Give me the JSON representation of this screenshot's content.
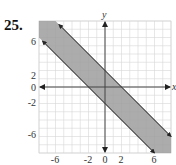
{
  "problem": {
    "number": "25."
  },
  "chart_data": {
    "type": "area",
    "title": "",
    "xlabel": "x",
    "ylabel": "y",
    "xlim": [
      -8,
      8
    ],
    "ylim": [
      -8,
      8
    ],
    "grid": true,
    "x_tick_labels": [
      "-6",
      "-2",
      "0",
      "2",
      "6"
    ],
    "x_ticks": [
      -6,
      -2,
      0,
      2,
      6
    ],
    "y_tick_labels": [
      "6",
      "2",
      "0",
      "-2",
      "-6"
    ],
    "y_ticks": [
      6,
      2,
      0,
      -2,
      -6
    ],
    "series": [
      {
        "name": "upper boundary",
        "equation": "y = -x + 2",
        "points": [
          [
            -6,
            8
          ],
          [
            8,
            -6
          ]
        ]
      },
      {
        "name": "lower boundary",
        "equation": "y = -x - 2",
        "points": [
          [
            -8,
            6
          ],
          [
            6,
            -8
          ]
        ]
      }
    ],
    "shaded_region": "-2 <= x + y <= 2",
    "colors": {
      "shade": "#9e9e9e",
      "grid": "#d4d4d4",
      "axis": "#444444",
      "boundary": "#333333"
    }
  }
}
